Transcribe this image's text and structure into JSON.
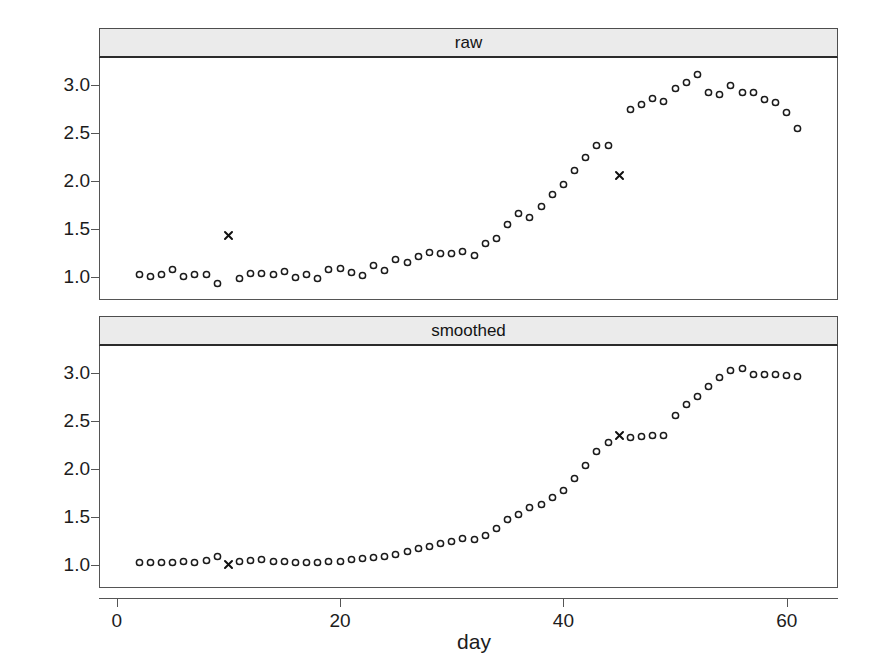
{
  "chart_data": {
    "type": "scatter",
    "title": "",
    "xlabel": "day",
    "ylabel": "outcome",
    "xlim": [
      -1.5,
      64.5
    ],
    "ylim": [
      0.78,
      3.28
    ],
    "xticks": [
      0,
      20,
      40,
      60
    ],
    "xticklabels": [
      "0",
      "20",
      "40",
      "60"
    ],
    "yticks": [
      1.0,
      1.5,
      2.0,
      2.5,
      3.0
    ],
    "yticklabels": [
      "1.0",
      "1.5",
      "2.0",
      "2.5",
      "3.0"
    ],
    "grid": false,
    "legend": null,
    "panel_labels": [
      "raw",
      "smoothed"
    ],
    "marker_circle": "open-circle",
    "marker_x": "x-cross",
    "marker_color": "#1a1a1a",
    "panels": [
      {
        "name": "raw",
        "strip_label": "raw",
        "series": [
          {
            "name": "observations",
            "marker": "open-circle",
            "x": [
              2,
              3,
              4,
              5,
              6,
              7,
              8,
              9,
              11,
              12,
              13,
              14,
              15,
              16,
              17,
              18,
              19,
              20,
              21,
              22,
              23,
              24,
              25,
              26,
              27,
              28,
              29,
              30,
              31,
              32,
              33,
              34,
              35,
              36,
              37,
              38,
              39,
              40,
              41,
              42,
              43,
              44,
              46,
              47,
              48,
              49,
              50,
              51,
              52,
              53,
              54,
              55,
              56,
              57,
              58,
              59,
              60,
              61
            ],
            "y": [
              1.02,
              1.0,
              1.03,
              1.08,
              1.0,
              1.03,
              1.03,
              0.93,
              0.98,
              1.04,
              1.04,
              1.02,
              1.06,
              0.99,
              1.02,
              0.98,
              1.08,
              1.09,
              1.05,
              1.01,
              1.12,
              1.07,
              1.18,
              1.15,
              1.21,
              1.25,
              1.24,
              1.24,
              1.26,
              1.22,
              1.35,
              1.4,
              1.55,
              1.66,
              1.62,
              1.73,
              1.86,
              1.96,
              2.11,
              2.24,
              2.37,
              2.37,
              2.74,
              2.8,
              2.86,
              2.83,
              2.96,
              3.03,
              3.11,
              2.92,
              2.9,
              2.99,
              2.92,
              2.92,
              2.85,
              2.82,
              2.71,
              2.55
            ]
          },
          {
            "name": "flagged",
            "marker": "x-cross",
            "x": [
              10,
              45
            ],
            "y": [
              1.43,
              2.06
            ]
          }
        ]
      },
      {
        "name": "smoothed",
        "strip_label": "smoothed",
        "series": [
          {
            "name": "observations",
            "marker": "open-circle",
            "x": [
              2,
              3,
              4,
              5,
              6,
              7,
              8,
              9,
              11,
              12,
              13,
              14,
              15,
              16,
              17,
              18,
              19,
              20,
              21,
              22,
              23,
              24,
              25,
              26,
              27,
              28,
              29,
              30,
              31,
              32,
              33,
              34,
              35,
              36,
              37,
              38,
              39,
              40,
              41,
              42,
              43,
              44,
              46,
              47,
              48,
              49,
              50,
              51,
              52,
              53,
              54,
              55,
              56,
              57,
              58,
              59,
              60,
              61
            ],
            "y": [
              1.02,
              1.02,
              1.02,
              1.03,
              1.04,
              1.02,
              1.05,
              1.09,
              1.04,
              1.05,
              1.06,
              1.04,
              1.04,
              1.03,
              1.03,
              1.03,
              1.04,
              1.04,
              1.06,
              1.07,
              1.08,
              1.09,
              1.11,
              1.14,
              1.17,
              1.19,
              1.22,
              1.24,
              1.27,
              1.26,
              1.31,
              1.38,
              1.47,
              1.53,
              1.6,
              1.63,
              1.7,
              1.78,
              1.9,
              2.04,
              2.18,
              2.28,
              2.33,
              2.34,
              2.35,
              2.35,
              2.56,
              2.67,
              2.75,
              2.86,
              2.95,
              3.03,
              3.05,
              2.98,
              2.98,
              2.98,
              2.97,
              2.96,
              2.92,
              2.87,
              2.78,
              2.7,
              2.55
            ]
          },
          {
            "name": "flagged",
            "marker": "x-cross",
            "x": [
              10,
              45
            ],
            "y": [
              1.0,
              2.35
            ]
          }
        ]
      }
    ]
  },
  "axes": {
    "ylabel": "outcome",
    "xlabel": "day"
  }
}
